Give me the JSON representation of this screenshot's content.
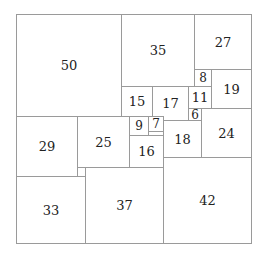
{
  "diagram": {
    "title": "",
    "type": "squared-square",
    "side": 112,
    "line_color": "#9a9a9a",
    "text_color": "#222222",
    "squares": [
      {
        "size": 50,
        "x": 0,
        "y": 0,
        "label": "50"
      },
      {
        "size": 35,
        "x": 50,
        "y": 0,
        "label": "35"
      },
      {
        "size": 27,
        "x": 85,
        "y": 0,
        "label": "27"
      },
      {
        "size": 8,
        "x": 85,
        "y": 27,
        "label": "8"
      },
      {
        "size": 19,
        "x": 93,
        "y": 27,
        "label": "19"
      },
      {
        "size": 15,
        "x": 50,
        "y": 35,
        "label": "15"
      },
      {
        "size": 17,
        "x": 65,
        "y": 35,
        "label": "17"
      },
      {
        "size": 11,
        "x": 82,
        "y": 35,
        "label": "11"
      },
      {
        "size": 6,
        "x": 82,
        "y": 46,
        "label": "6"
      },
      {
        "size": 24,
        "x": 88,
        "y": 46,
        "label": "24"
      },
      {
        "size": 29,
        "x": 0,
        "y": 50,
        "label": "29"
      },
      {
        "size": 25,
        "x": 29,
        "y": 50,
        "label": "25"
      },
      {
        "size": 9,
        "x": 54,
        "y": 50,
        "label": "9"
      },
      {
        "size": 7,
        "x": 63,
        "y": 50,
        "label": "7"
      },
      {
        "size": 18,
        "x": 70,
        "y": 52,
        "label": "18"
      },
      {
        "size": 16,
        "x": 54,
        "y": 59,
        "label": "16"
      },
      {
        "size": 4,
        "x": 29,
        "y": 75,
        "label": ""
      },
      {
        "size": 42,
        "x": 70,
        "y": 70,
        "label": "42"
      },
      {
        "size": 37,
        "x": 33,
        "y": 75,
        "label": "37"
      },
      {
        "size": 33,
        "x": 0,
        "y": 79,
        "label": "33"
      }
    ]
  }
}
